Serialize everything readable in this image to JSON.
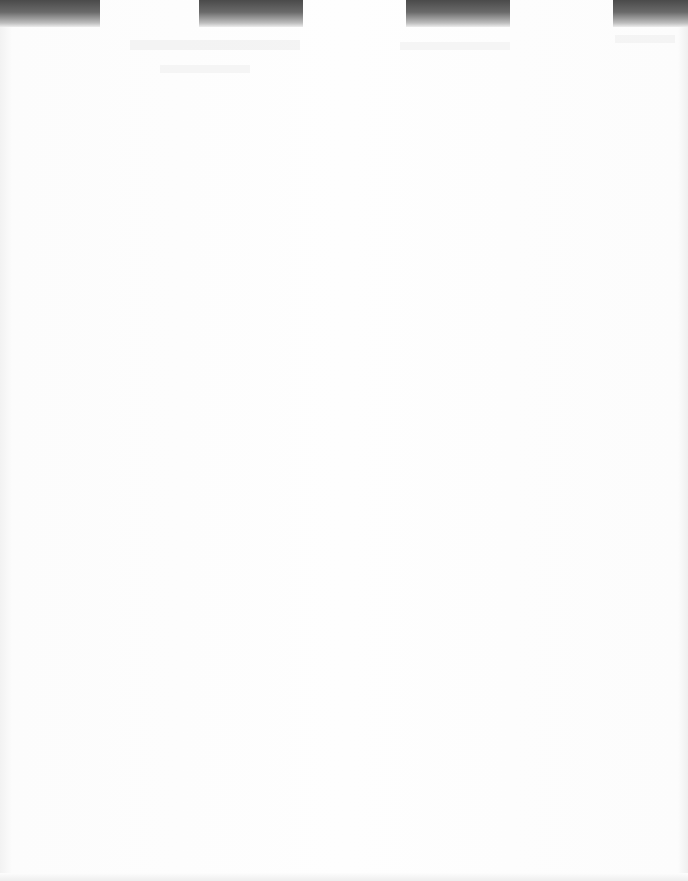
{
  "page": {
    "type": "scanned-blank-page",
    "background_color": "#fdfdfd",
    "tab_color_top": "#4a4a4a",
    "tabs": [
      {
        "left": 0,
        "width": 100
      },
      {
        "left": 199,
        "width": 104
      },
      {
        "left": 406,
        "width": 104
      },
      {
        "left": 613,
        "width": 75
      }
    ],
    "text": []
  }
}
